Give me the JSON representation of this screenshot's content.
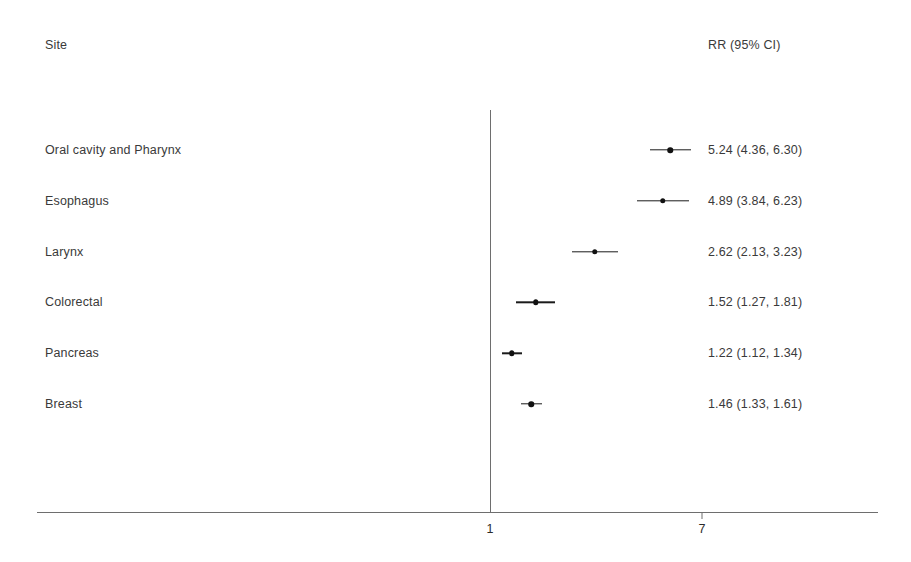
{
  "header": {
    "site_label": "Site",
    "rr_label": "RR (95% CI)"
  },
  "axis": {
    "ticks": [
      {
        "label": "1",
        "value": 1
      },
      {
        "label": "7",
        "value": 7
      }
    ]
  },
  "chart_data": {
    "type": "scatter",
    "chart_style": "forest-plot",
    "title": "",
    "xlabel": "",
    "ylabel": "Site",
    "x_scale": "log",
    "xlim": [
      1,
      7
    ],
    "grid": false,
    "legend": null,
    "reference_line": 1,
    "columns": [
      "Site",
      "RR (95% CI)"
    ],
    "categories": [
      "Oral cavity and Pharynx",
      "Esophagus",
      "Larynx",
      "Colorectal",
      "Pancreas",
      "Breast"
    ],
    "values": [
      5.24,
      4.89,
      2.62,
      1.52,
      1.22,
      1.46
    ],
    "ci_lower": [
      4.36,
      3.84,
      2.13,
      1.27,
      1.12,
      1.33
    ],
    "ci_upper": [
      6.3,
      6.23,
      3.23,
      1.81,
      1.34,
      1.61
    ],
    "rows": [
      {
        "site": "Oral cavity and Pharynx",
        "rr": 5.24,
        "lo": 4.36,
        "hi": 6.3,
        "text": "5.24 (4.36, 6.30)"
      },
      {
        "site": "Esophagus",
        "rr": 4.89,
        "lo": 3.84,
        "hi": 6.23,
        "text": "4.89 (3.84, 6.23)"
      },
      {
        "site": "Larynx",
        "rr": 2.62,
        "lo": 2.13,
        "hi": 3.23,
        "text": "2.62 (2.13, 3.23)"
      },
      {
        "site": "Colorectal",
        "rr": 1.52,
        "lo": 1.27,
        "hi": 1.81,
        "text": "1.52 (1.27, 1.81)"
      },
      {
        "site": "Pancreas",
        "rr": 1.22,
        "lo": 1.12,
        "hi": 1.34,
        "text": "1.22 (1.12, 1.34)"
      },
      {
        "site": "Breast",
        "rr": 1.46,
        "lo": 1.33,
        "hi": 1.61,
        "text": "1.46 (1.33, 1.61)"
      }
    ]
  },
  "colors": {
    "marker": "#111111",
    "line": "#1b1b1b",
    "axis": "#6e6e6e",
    "text": "#3a3a3a",
    "background": "#ffffff"
  }
}
